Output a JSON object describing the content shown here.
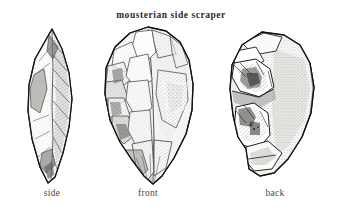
{
  "plate": {
    "title": "mousterian side scraper",
    "background_color": "#ffffff",
    "ink_color": "#1f1f1f",
    "caption_color": "#4a4a4a",
    "width": 342,
    "height": 212
  },
  "figures": [
    {
      "id": "side",
      "caption": "side",
      "view": "side profile",
      "description": "narrow elongated lens-shaped biface profile, pointed at top and bottom, with long vertical flake-scar ridges and hatched shading"
    },
    {
      "id": "front",
      "caption": "front",
      "view": "front face",
      "description": "broad ovate teardrop face covered in large irregular flake scars with dense stipple and hatch shading, pointed lower tip"
    },
    {
      "id": "back",
      "caption": "back",
      "view": "back face",
      "description": "rounded cortex-covered back with stippled surface and a cluster of flake scars along the left margin"
    }
  ]
}
